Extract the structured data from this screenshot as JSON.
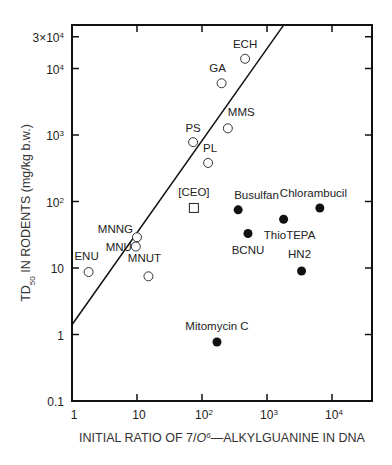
{
  "chart_data": {
    "type": "scatter",
    "title": "",
    "xlabel": "INITIAL RATIO OF 7/O6—ALKYLGUANINE IN DNA",
    "ylabel": "TD50 IN RODENTS (mg/kg b.w.)",
    "xscale": "log",
    "yscale": "log",
    "xlim": [
      1,
      40000
    ],
    "ylim": [
      0.1,
      30000
    ],
    "x_ticks": [
      {
        "value": 1,
        "label": "1"
      },
      {
        "value": 10,
        "label": "10"
      },
      {
        "value": 100,
        "label": "10^2"
      },
      {
        "value": 1000,
        "label": "10^3"
      },
      {
        "value": 10000,
        "label": "10^4"
      }
    ],
    "y_ticks": [
      {
        "value": 0.1,
        "label": "0.1"
      },
      {
        "value": 1,
        "label": "1"
      },
      {
        "value": 10,
        "label": "10"
      },
      {
        "value": 100,
        "label": "10^2"
      },
      {
        "value": 1000,
        "label": "10^3"
      },
      {
        "value": 10000,
        "label": "10^4"
      },
      {
        "value": 30000,
        "label": "3x10^4"
      }
    ],
    "grid": false,
    "series": [
      {
        "name": "open circles",
        "marker": "open-circle",
        "points": [
          {
            "label": "ENU",
            "x": 1.8,
            "y": 8.7
          },
          {
            "label": "MNU",
            "x": 9.6,
            "y": 21
          },
          {
            "label": "MNNG",
            "x": 10,
            "y": 29
          },
          {
            "label": "MNUT",
            "x": 15,
            "y": 7.5
          },
          {
            "label": "PS",
            "x": 73,
            "y": 780
          },
          {
            "label": "PL",
            "x": 124,
            "y": 380
          },
          {
            "label": "MMS",
            "x": 250,
            "y": 1260
          },
          {
            "label": "GA",
            "x": 200,
            "y": 6000
          },
          {
            "label": "ECH",
            "x": 460,
            "y": 14000
          }
        ]
      },
      {
        "name": "open square",
        "marker": "open-square",
        "points": [
          {
            "label": "[CEO]",
            "x": 75,
            "y": 80
          }
        ]
      },
      {
        "name": "filled circles",
        "marker": "filled-circle",
        "points": [
          {
            "label": "Busulfan",
            "x": 360,
            "y": 75
          },
          {
            "label": "BCNU",
            "x": 510,
            "y": 33
          },
          {
            "label": "ThioTEPA",
            "x": 1800,
            "y": 54
          },
          {
            "label": "Chlorambucil",
            "x": 6500,
            "y": 80
          },
          {
            "label": "HN2",
            "x": 3400,
            "y": 9
          },
          {
            "label": "Mitomycin C",
            "x": 170,
            "y": 0.77
          }
        ]
      }
    ],
    "fit_line": {
      "x": [
        1,
        1800
      ],
      "y": [
        1.4,
        45000
      ]
    }
  },
  "labels": {
    "xlabel_pre": "INITIAL RATIO OF 7/",
    "xlabel_italic": "O",
    "xlabel_sup": "6",
    "xlabel_post": "—ALKYLGUANINE IN DNA",
    "ylabel_pre": "TD",
    "ylabel_sub": "50",
    "ylabel_post": " IN RODENTS (mg/kg b.w.)"
  }
}
